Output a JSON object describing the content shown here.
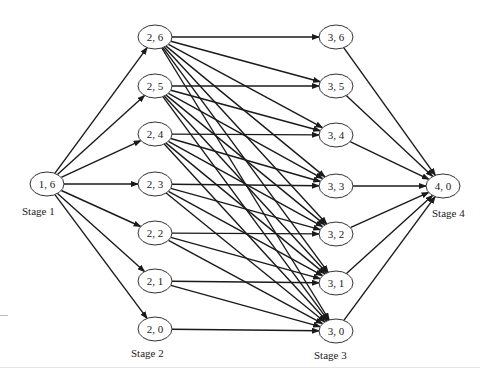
{
  "diagram": {
    "type": "staged-network",
    "stages": [
      {
        "label": "Stage 1",
        "nodes": [
          {
            "id": "1,6",
            "text": "1, 6",
            "x": 47,
            "y": 184
          }
        ]
      },
      {
        "label": "Stage 2",
        "nodes": [
          {
            "id": "2,6",
            "text": "2, 6",
            "x": 155,
            "y": 37
          },
          {
            "id": "2,5",
            "text": "2, 5",
            "x": 155,
            "y": 86
          },
          {
            "id": "2,4",
            "text": "2, 4",
            "x": 155,
            "y": 134
          },
          {
            "id": "2,3",
            "text": "2, 3",
            "x": 155,
            "y": 184
          },
          {
            "id": "2,2",
            "text": "2, 2",
            "x": 155,
            "y": 233
          },
          {
            "id": "2,1",
            "text": "2, 1",
            "x": 155,
            "y": 281
          },
          {
            "id": "2,0",
            "text": "2, 0",
            "x": 155,
            "y": 329
          }
        ]
      },
      {
        "label": "Stage 3",
        "nodes": [
          {
            "id": "3,6",
            "text": "3, 6",
            "x": 336,
            "y": 37
          },
          {
            "id": "3,5",
            "text": "3, 5",
            "x": 336,
            "y": 86
          },
          {
            "id": "3,4",
            "text": "3, 4",
            "x": 336,
            "y": 135
          },
          {
            "id": "3,3",
            "text": "3, 3",
            "x": 336,
            "y": 186
          },
          {
            "id": "3,2",
            "text": "3, 2",
            "x": 336,
            "y": 234
          },
          {
            "id": "3,1",
            "text": "3, 1",
            "x": 336,
            "y": 283
          },
          {
            "id": "3,0",
            "text": "3, 0",
            "x": 336,
            "y": 331
          }
        ]
      },
      {
        "label": "Stage 4",
        "nodes": [
          {
            "id": "4,0",
            "text": "4, 0",
            "x": 443,
            "y": 186
          }
        ]
      }
    ],
    "labels": {
      "stage1": "Stage 1",
      "stage2": "Stage 2",
      "stage3": "Stage 3",
      "stage4": "Stage 4"
    },
    "edge_rule": "Stage1→every Stage2 node; (2,j)→(3,k) for all k≤j; every Stage3 node→(4,0)",
    "colors": {
      "stroke": "#1a1a1a",
      "node_fill": "#ffffff",
      "text": "#222222"
    }
  }
}
